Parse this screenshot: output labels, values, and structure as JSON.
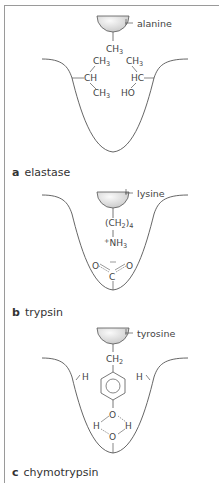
{
  "panels": [
    {
      "letter": "a",
      "enzyme": "elastase",
      "substrate_label": "alanine",
      "substrate_group": "CH3",
      "pocket_groups": [
        {
          "left_group": "CH",
          "left_substituents": [
            "CH3",
            "CH3"
          ]
        },
        {
          "right_group": "HC",
          "right_substituents": [
            "CH3",
            "HO"
          ]
        }
      ]
    },
    {
      "letter": "b",
      "enzyme": "trypsin",
      "substrate_label": "lysine",
      "substrate_chain": "(CH2)4",
      "substrate_terminal": "+NH3",
      "pocket_group": "carboxylate O-C-O"
    },
    {
      "letter": "c",
      "enzyme": "chymotrypsin",
      "substrate_label": "tyrosine",
      "substrate_chain": "CH2",
      "ring": "phenol ring",
      "pocket_groups": [
        "H",
        "H",
        "water H-O-H hydrogen bonded"
      ]
    }
  ],
  "colors": {
    "line": "#555555",
    "text": "#444444",
    "frame": "#9a9a9a",
    "ball_light": "#f4f4f4",
    "ball_dark": "#c8c8c8"
  }
}
